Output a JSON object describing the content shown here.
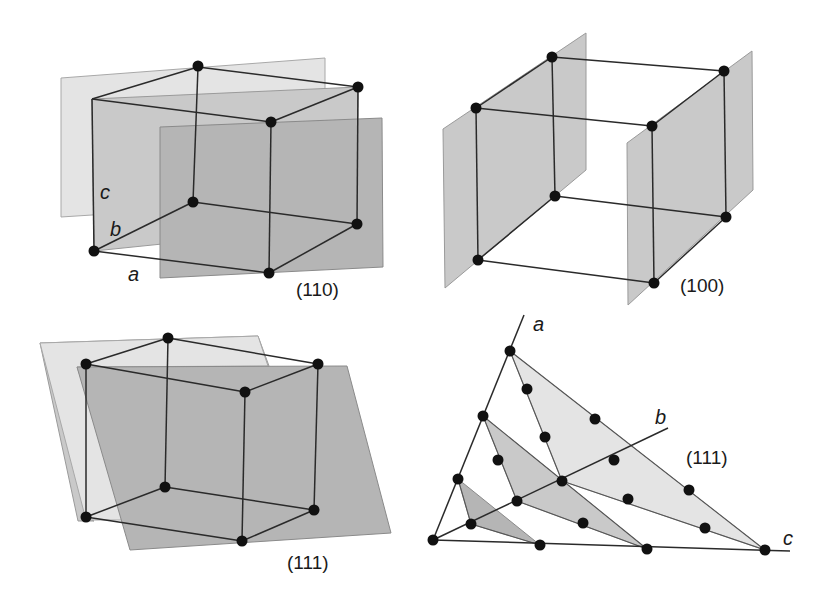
{
  "figure": {
    "colors": {
      "background": "#ffffff",
      "edge": "#2a2a2a",
      "atom": "#111111",
      "plane_light": "#e4e4e4",
      "plane_mid": "#c9c9c9",
      "plane_dark": "#b5b5b5"
    },
    "panels": [
      {
        "id": "panel-110",
        "plane_label": "(110)",
        "axis_labels": {
          "a": "a",
          "b": "b",
          "c": "c"
        }
      },
      {
        "id": "panel-100",
        "plane_label": "(100)"
      },
      {
        "id": "panel-111-cube",
        "plane_label": "(111)"
      },
      {
        "id": "panel-111-axes",
        "plane_label": "(111)",
        "axis_labels": {
          "a": "a",
          "b": "b",
          "c": "c"
        }
      }
    ]
  }
}
